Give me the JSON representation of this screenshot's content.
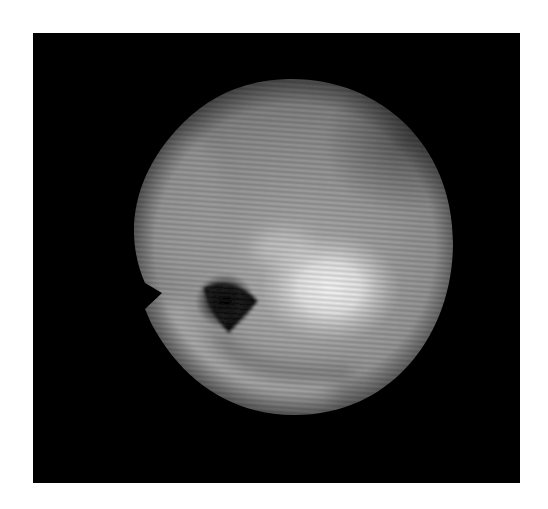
{
  "image": {
    "description": "Grayscale image of a bright circular disc on a black square background with fine diagonal horizontal fringe stripes, a notch on the left edge, a dark triangular spot left of center and a bright highlight right of center",
    "background_color": "#ffffff",
    "frame_color": "#000000",
    "disc": {
      "center_x": 257,
      "center_y": 214,
      "radius_x": 163,
      "radius_y": 168,
      "base_gray": "#8a8a8a",
      "edge_gray": "#2a2a2a"
    },
    "bright_spot": {
      "cx": 297,
      "cy": 258,
      "r": 55,
      "color": "#f4f4f4"
    },
    "dark_spot": {
      "cx": 192,
      "cy": 271,
      "r": 22,
      "color": "#050505"
    },
    "notch": {
      "tip_x": 129,
      "tip_y": 260
    },
    "stripe_period_px": 5,
    "stripe_angle_deg": 4
  }
}
